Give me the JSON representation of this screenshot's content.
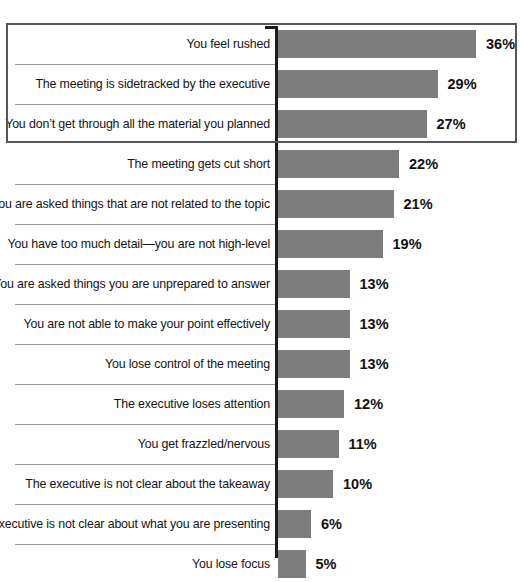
{
  "chart_data": {
    "type": "bar",
    "orientation": "horizontal",
    "title": "",
    "subtitle": "",
    "xlabel": "",
    "ylabel": "",
    "xlim": [
      0,
      40
    ],
    "grid": false,
    "legend": null,
    "value_suffix": "%",
    "categories": [
      "You feel rushed",
      "The meeting is sidetracked by the executive",
      "You don’t get through all the material you planned",
      "The meeting gets cut short",
      "You are asked things that are not related to the topic",
      "You have too much detail—you are not high-level",
      "You are asked things you are unprepared to answer",
      "You are not able to make your point effectively",
      "You lose control of the meeting",
      "The executive loses attention",
      "You get frazzled/nervous",
      "The executive is not clear about the takeaway",
      "The executive is not clear about what you are presenting",
      "You lose focus"
    ],
    "values": [
      36,
      29,
      27,
      22,
      21,
      19,
      13,
      13,
      13,
      12,
      11,
      10,
      6,
      5
    ],
    "value_labels": [
      "36%",
      "29%",
      "27%",
      "22%",
      "21%",
      "19%",
      "13%",
      "13%",
      "13%",
      "12%",
      "11%",
      "10%",
      "6%",
      "5%"
    ],
    "highlighted_categories": [
      "You feel rushed",
      "The meeting is sidetracked by the executive",
      "You don’t get through all the material you planned"
    ],
    "colors": {
      "bar": "#7c7c7c",
      "axis": "#1c1c1c",
      "highlight_border": "#55565a",
      "separator": "#9a9a9a",
      "label_text": "#151515",
      "value_text": "#111111",
      "background": "#fefefe"
    }
  },
  "rows": [
    {
      "label": "You feel rushed",
      "value": 36,
      "value_label": "36%",
      "separator": false,
      "highlighted": true
    },
    {
      "label": "The meeting is sidetracked by the executive",
      "value": 29,
      "value_label": "29%",
      "separator": true,
      "highlighted": true
    },
    {
      "label": "You don’t get through all the material you planned",
      "value": 27,
      "value_label": "27%",
      "separator": true,
      "highlighted": true
    },
    {
      "label": "The meeting gets cut short",
      "value": 22,
      "value_label": "22%",
      "separator": false,
      "highlighted": false
    },
    {
      "label": "You are asked things that are not related to the topic",
      "value": 21,
      "value_label": "21%",
      "separator": true,
      "highlighted": false
    },
    {
      "label": "You have too much detail—you are not high-level",
      "value": 19,
      "value_label": "19%",
      "separator": true,
      "highlighted": false
    },
    {
      "label": "You are asked things you are unprepared to answer",
      "value": 13,
      "value_label": "13%",
      "separator": true,
      "highlighted": false
    },
    {
      "label": "You are not able to make your point effectively",
      "value": 13,
      "value_label": "13%",
      "separator": true,
      "highlighted": false
    },
    {
      "label": "You lose control of the meeting",
      "value": 13,
      "value_label": "13%",
      "separator": true,
      "highlighted": false
    },
    {
      "label": "The executive loses attention",
      "value": 12,
      "value_label": "12%",
      "separator": true,
      "highlighted": false
    },
    {
      "label": "You get frazzled/nervous",
      "value": 11,
      "value_label": "11%",
      "separator": true,
      "highlighted": false
    },
    {
      "label": "The executive is not clear about the takeaway",
      "value": 10,
      "value_label": "10%",
      "separator": true,
      "highlighted": false
    },
    {
      "label": "The executive is not clear about what you are presenting",
      "value": 6,
      "value_label": "6%",
      "separator": true,
      "highlighted": false
    },
    {
      "label": "You lose focus",
      "value": 5,
      "value_label": "5%",
      "separator": true,
      "highlighted": false
    }
  ],
  "layout": {
    "row_height": 40,
    "first_row_top": 30,
    "axis_x": 275,
    "bar_start_x": 278,
    "px_per_percent": 5.5,
    "value_gap": 10
  }
}
